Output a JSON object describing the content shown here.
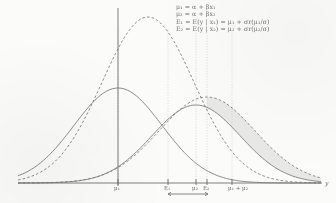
{
  "chart_data": {
    "type": "line",
    "title": "",
    "xlabel": "y",
    "ylabel": "",
    "grid": "vertical dotted gridlines at labeled tick positions",
    "legend": "none",
    "axis": {
      "baseline_y": 183,
      "vertical_axis_x": 118,
      "x_start": 18,
      "x_end": 322
    },
    "x_ticks": [
      {
        "label": "μ₁",
        "x": 118
      },
      {
        "label": "E₁",
        "x": 168
      },
      {
        "label": "μ₂",
        "x": 196
      },
      {
        "label": "E₂",
        "x": 207
      },
      {
        "label": "μ₁ + μ₂",
        "x": 232
      }
    ],
    "series": [
      {
        "name": "solid-density-1",
        "style": "solid",
        "peak_x": 118,
        "peak_height": 95,
        "spread": 44,
        "description": "normal density centred at mu_1"
      },
      {
        "name": "solid-density-2",
        "style": "solid",
        "peak_x": 196,
        "peak_height": 78,
        "spread": 44,
        "description": "normal density centred at mu_2, lower peak"
      },
      {
        "name": "dashed-density-1",
        "style": "dashed",
        "peak_x": 148,
        "peak_height": 166,
        "spread": 46,
        "description": "tall dashed density, truncated/conditional distribution at E_1"
      },
      {
        "name": "dashed-density-2",
        "style": "dashed",
        "peak_x": 207,
        "peak_height": 86,
        "spread": 48,
        "description": "dashed density shifted right, conditional distribution at E_2"
      }
    ],
    "shaded_region": {
      "name": "tail-difference-shading",
      "from_x": 207,
      "to_x": 322,
      "fill": "#e6e6e4",
      "description": "light grey fill between the right tails of the two right-hand curves"
    },
    "measure_arrow": {
      "from_label": "E₁",
      "to_label": "E₂",
      "from_x": 168,
      "to_x": 208,
      "y": 194
    }
  },
  "annotations": {
    "lines": [
      "μ₁ = α + βx₁",
      "μ₂ = α + βx₂",
      "E₁ = E(y | x₁) = μ₁ + σr(μ₁/σ)",
      "E₂ = E(y | x₂) = μ₂ + σr(μ₂/σ)"
    ]
  },
  "colors": {
    "paper": "#fbfbf9",
    "ink": "#76767a",
    "ink_dark": "#6b6b70",
    "shade": "#e6e6e4",
    "grid": "#c9c9c6"
  }
}
